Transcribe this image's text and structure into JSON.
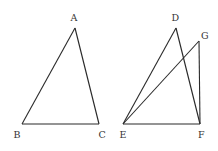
{
  "diagram": {
    "type": "geometry",
    "colors": {
      "stroke": "#2a2a2a",
      "label": "#333333",
      "background": "#ffffff"
    },
    "figures": [
      {
        "name": "triangle-ABC",
        "vertices": [
          "A",
          "B",
          "C"
        ],
        "segments": [
          [
            "A",
            "B"
          ],
          [
            "B",
            "C"
          ],
          [
            "C",
            "A"
          ]
        ]
      },
      {
        "name": "triangles-DEF-GEF",
        "vertices": [
          "D",
          "E",
          "F",
          "G"
        ],
        "segments": [
          [
            "D",
            "E"
          ],
          [
            "D",
            "F"
          ],
          [
            "E",
            "F"
          ],
          [
            "G",
            "E"
          ],
          [
            "G",
            "F"
          ]
        ]
      }
    ],
    "labels": {
      "A": "A",
      "B": "B",
      "C": "C",
      "D": "D",
      "E": "E",
      "F": "F",
      "G": "G"
    }
  }
}
